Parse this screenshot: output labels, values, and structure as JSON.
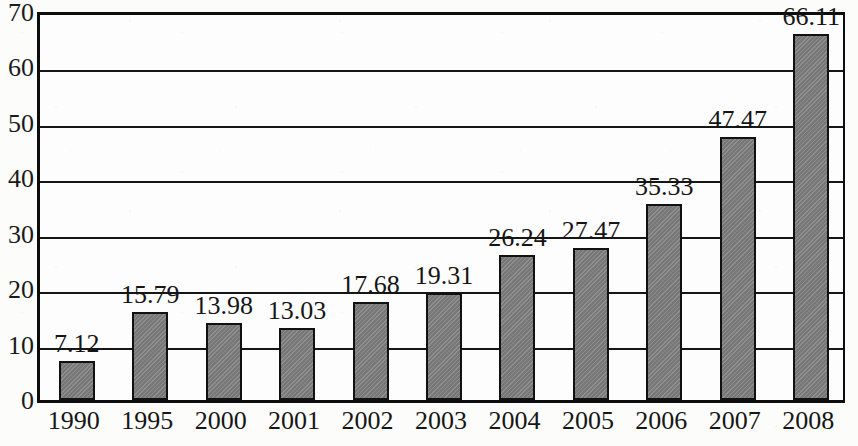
{
  "chart_data": {
    "type": "bar",
    "title": "",
    "subtitle": "",
    "xlabel": "",
    "ylabel": "",
    "categories": [
      "1990",
      "1995",
      "2000",
      "2001",
      "2002",
      "2003",
      "2004",
      "2005",
      "2006",
      "2007",
      "2008"
    ],
    "values": [
      7.12,
      15.79,
      13.98,
      13.03,
      17.68,
      19.31,
      26.24,
      27.47,
      35.33,
      47.47,
      66.11
    ],
    "data_labels": [
      "7.12",
      "15.79",
      "13.98",
      "13.03",
      "17.68",
      "19.31",
      "26.24",
      "27.47",
      "35.33",
      "47.47",
      "66.11"
    ],
    "ylim": [
      0,
      70
    ],
    "y_ticks": [
      0,
      10,
      20,
      30,
      40,
      50,
      60,
      70
    ],
    "y_tick_labels": [
      "0",
      "10",
      "20",
      "30",
      "40",
      "50",
      "60",
      "70"
    ],
    "grid": true,
    "grid_axis": "y",
    "legend": false,
    "legend_position": "none",
    "series": [
      {
        "name": "",
        "values": [
          7.12,
          15.79,
          13.98,
          13.03,
          17.68,
          19.31,
          26.24,
          27.47,
          35.33,
          47.47,
          66.11
        ]
      }
    ],
    "colors": {
      "bar_fill": "#7e7e7e",
      "bar_border": "#111111",
      "gridline": "#161616",
      "axis": "#0d0d0d",
      "text": "#151515",
      "background": "#fcfcfb"
    }
  }
}
